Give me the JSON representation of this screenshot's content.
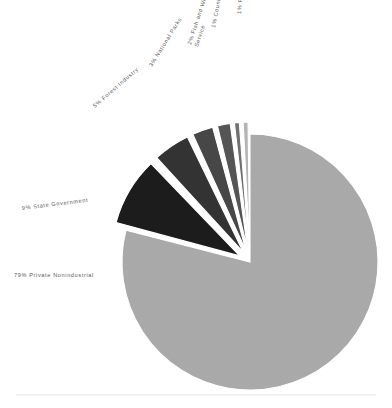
{
  "chart_data": {
    "type": "pie",
    "title": "",
    "subtitle": "",
    "xlabel": "",
    "ylabel": "",
    "legend_position": "none",
    "grid": false,
    "value_unit": "percent",
    "total": 100,
    "categories": [
      "Private Nonindustrial",
      "State Government",
      "Forest Industry",
      "National Parks",
      "Fish and Wildlife Service",
      "County/Municipal",
      "Federal Government"
    ],
    "values": [
      79,
      9,
      5,
      3,
      2,
      1,
      1
    ],
    "labels": [
      "79% Private Nonindustrial",
      "9% State Government",
      "5% Forest Industry",
      "3% National Parks",
      "2% Fish and Wildlife Service",
      "1% County/Municipal",
      "1% Federal Government"
    ],
    "colors": [
      "#a9a9a9",
      "#1c1c1c",
      "#333333",
      "#474747",
      "#555555",
      "#6f6f6f",
      "#b4b4b4"
    ],
    "slices": [
      {
        "name": "private-nonindustrial",
        "label": "79% Private Nonindustrial",
        "label_lines": [
          "79% Private Nonindustrial"
        ],
        "percent": 79,
        "color": "#a9a9a9",
        "exploded": false,
        "label_x": 14,
        "label_y": 277,
        "label_rotation": 0,
        "label_anchor": "start"
      },
      {
        "name": "state-government",
        "label": "9% State Government",
        "label_lines": [
          "9% State Government"
        ],
        "percent": 9,
        "color": "#1c1c1c",
        "exploded": true,
        "label_x": 22,
        "label_y": 210,
        "label_rotation": -7,
        "label_anchor": "start"
      },
      {
        "name": "forest-industry",
        "label": "5% Forest Industry",
        "label_lines": [
          "5% Forest Industry"
        ],
        "percent": 5,
        "color": "#333333",
        "exploded": true,
        "label_x": 95,
        "label_y": 108,
        "label_rotation": -41,
        "label_anchor": "start"
      },
      {
        "name": "national-parks",
        "label": "3% National Parks",
        "label_lines": [
          "3% National Parks"
        ],
        "percent": 3,
        "color": "#474747",
        "exploded": true,
        "label_x": 152,
        "label_y": 67,
        "label_rotation": -58,
        "label_anchor": "start"
      },
      {
        "name": "fish-and-wildlife-service",
        "label": "2% Fish and Wildlife Service",
        "label_lines": [
          "2% Fish and Wildlife",
          "Service"
        ],
        "percent": 2,
        "color": "#555555",
        "exploded": true,
        "label_x": 191,
        "label_y": 45,
        "label_rotation": -72,
        "label_anchor": "start"
      },
      {
        "name": "county-municipal",
        "label": "1% County/Municipal",
        "label_lines": [
          "1% County/Municipal"
        ],
        "percent": 1,
        "color": "#6f6f6f",
        "exploded": true,
        "label_x": 215,
        "label_y": 28,
        "label_rotation": -79,
        "label_anchor": "start"
      },
      {
        "name": "federal-government",
        "label": "1% Federal Government",
        "label_lines": [
          "1% Federal Government"
        ],
        "percent": 1,
        "color": "#b4b4b4",
        "exploded": true,
        "label_x": 241,
        "label_y": 14,
        "label_rotation": -85,
        "label_anchor": "start"
      }
    ],
    "geometry": {
      "center_x": 250,
      "center_y": 262,
      "radius": 128,
      "start_angle_deg": -90,
      "explode_distance": 12,
      "gap_deg": 1.4
    },
    "footer_rule": {
      "x1": 16,
      "x2": 376,
      "y": 395,
      "color": "#e2e2e2"
    }
  }
}
